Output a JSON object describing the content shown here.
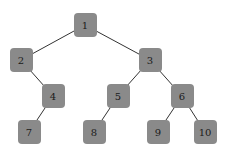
{
  "diagram": {
    "type": "tree",
    "node_color": "#8a8a8a",
    "edge_color": "#333333",
    "text_color": "#1a1a1a",
    "nodes": [
      {
        "id": "1",
        "label": "1",
        "cx": 85,
        "cy": 25
      },
      {
        "id": "2",
        "label": "2",
        "cx": 21,
        "cy": 60
      },
      {
        "id": "3",
        "label": "3",
        "cx": 150,
        "cy": 60
      },
      {
        "id": "4",
        "label": "4",
        "cx": 53,
        "cy": 96
      },
      {
        "id": "5",
        "label": "5",
        "cx": 118,
        "cy": 96
      },
      {
        "id": "6",
        "label": "6",
        "cx": 182,
        "cy": 96
      },
      {
        "id": "7",
        "label": "7",
        "cx": 29,
        "cy": 132
      },
      {
        "id": "8",
        "label": "8",
        "cx": 94,
        "cy": 132
      },
      {
        "id": "9",
        "label": "9",
        "cx": 158,
        "cy": 132
      },
      {
        "id": "10",
        "label": "10",
        "cx": 205,
        "cy": 132
      }
    ],
    "edges": [
      {
        "from": "1",
        "to": "2"
      },
      {
        "from": "1",
        "to": "3"
      },
      {
        "from": "2",
        "to": "4"
      },
      {
        "from": "3",
        "to": "5"
      },
      {
        "from": "3",
        "to": "6"
      },
      {
        "from": "4",
        "to": "7"
      },
      {
        "from": "5",
        "to": "8"
      },
      {
        "from": "6",
        "to": "9"
      },
      {
        "from": "6",
        "to": "10"
      }
    ]
  }
}
